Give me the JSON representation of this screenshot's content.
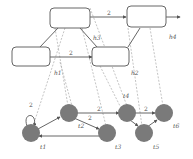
{
  "diagram": {
    "colors": {
      "node_fill": "#7a7a7a",
      "box_stroke": "#666666",
      "edge": "#555555",
      "dashed": "#aaaaaa"
    },
    "top_edges": {
      "a_to_b": "2",
      "c_to_d": "2"
    },
    "mapping_labels": {
      "h1": "h1",
      "h2": "h2",
      "h3": "h3",
      "h4": "h4"
    },
    "bottom_edges": {
      "self_loop_t1": "2",
      "t2_to_t4": "2",
      "t2_to_t3": "2",
      "t4_to_t6": "2"
    },
    "nodes": {
      "t1": "t1",
      "t2": "t2",
      "t3": "t3",
      "t4": "t4",
      "t5": "t5",
      "t6": "t6"
    }
  }
}
